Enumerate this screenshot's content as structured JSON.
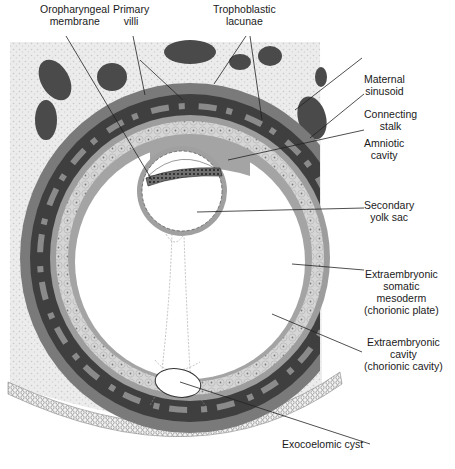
{
  "figure": {
    "colors": {
      "background": "#ffffff",
      "maternal_tissue": "#e6e6e6",
      "maternal_sinusoid": "#4a4a4a",
      "syncytiotrophoblast": "#6a6a6a",
      "trophoblastic_lacunae": "#3e3e3e",
      "cytotrophoblast": "#a8a8a8",
      "cell_layer": "#d4d4d4",
      "extraembryonic_mesoderm": "#9a9a9a",
      "cavity": "#ffffff",
      "leader_line": "#222222"
    }
  },
  "labels": {
    "top": [
      {
        "id": "oropharyngeal-membrane",
        "lines": [
          "Oropharyngeal",
          "membrane"
        ]
      },
      {
        "id": "primary-villi",
        "lines": [
          "Primary",
          "villi"
        ]
      },
      {
        "id": "trophoblastic-lacunae",
        "lines": [
          "Trophoblastic",
          "lacunae"
        ]
      }
    ],
    "right": [
      {
        "id": "maternal-sinusoid",
        "lines": [
          "Maternal",
          "sinusoid"
        ]
      },
      {
        "id": "connecting-stalk",
        "lines": [
          "Connecting",
          "stalk"
        ]
      },
      {
        "id": "amniotic-cavity",
        "lines": [
          "Amniotic",
          "cavity"
        ]
      },
      {
        "id": "secondary-yolk-sac",
        "lines": [
          "Secondary",
          "yolk sac"
        ]
      },
      {
        "id": "extraembryonic-somatic-mesoderm",
        "lines": [
          "Extraembryonic",
          "somatic",
          "mesoderm",
          "(chorionic plate)"
        ]
      },
      {
        "id": "extraembryonic-cavity",
        "lines": [
          "Extraembryonic",
          "cavity",
          "(chorionic cavity)"
        ]
      },
      {
        "id": "exocoelomic-cyst",
        "lines": [
          "Exocoelomic cyst"
        ]
      }
    ]
  }
}
